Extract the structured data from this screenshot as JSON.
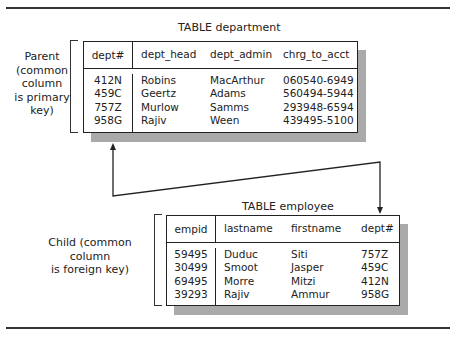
{
  "department": {
    "title": "TABLE department",
    "side_label": [
      "Parent",
      "(common",
      "column",
      "is primary",
      "key)"
    ],
    "columns": [
      "dept#",
      "dept_head",
      "dept_admin",
      "chrg_to_acct"
    ],
    "rows": [
      [
        "412N",
        "Robins",
        "MacArthur",
        "060540-6949"
      ],
      [
        "459C",
        "Geertz",
        "Adams",
        "560494-5944"
      ],
      [
        "757Z",
        "Murlow",
        "Samms",
        "293948-6594"
      ],
      [
        "958G",
        "Rajiv",
        "Ween",
        "439495-5100"
      ]
    ]
  },
  "employee": {
    "title": "TABLE employee",
    "side_label": [
      "Child (common column",
      "is foreign key)"
    ],
    "columns": [
      "empid",
      "lastname",
      "firstname",
      "dept#"
    ],
    "rows": [
      [
        "59495",
        "Duduc",
        "Siti",
        "757Z"
      ],
      [
        "30499",
        "Smoot",
        "Jasper",
        "459C"
      ],
      [
        "69495",
        "Morre",
        "Mitzi",
        "412N"
      ],
      [
        "39293",
        "Rajiv",
        "Ammur",
        "958G"
      ]
    ]
  },
  "colors": {
    "line": "#222222",
    "shadow": "#aaaaaa"
  }
}
